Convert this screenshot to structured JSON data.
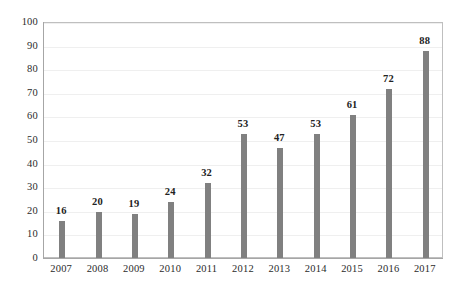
{
  "chart_data": {
    "type": "bar",
    "title": "",
    "subtitle": "",
    "xlabel": "",
    "ylabel": "",
    "categories": [
      "2007",
      "2008",
      "2009",
      "2010",
      "2011",
      "2012",
      "2013",
      "2014",
      "2015",
      "2016",
      "2017"
    ],
    "values": [
      16,
      20,
      19,
      24,
      32,
      53,
      47,
      53,
      61,
      72,
      88
    ],
    "data_labels": [
      "16",
      "20",
      "19",
      "24",
      "32",
      "53",
      "47",
      "53",
      "61",
      "72",
      "88"
    ],
    "ylim": [
      0,
      100
    ],
    "y_ticks": [
      0,
      10,
      20,
      30,
      40,
      50,
      60,
      70,
      80,
      90,
      100
    ],
    "y_tick_labels": [
      "0",
      "10",
      "20",
      "30",
      "40",
      "50",
      "60",
      "70",
      "80",
      "90",
      "100"
    ],
    "grid": true,
    "grid_axis": "y",
    "legend": false,
    "legend_position": "none",
    "series": [
      {
        "name": "",
        "values": [
          16,
          20,
          19,
          24,
          32,
          53,
          47,
          53,
          61,
          72,
          88
        ],
        "color": "#808080"
      }
    ]
  },
  "style": {
    "bar_color": "#808080",
    "gridline_color": "#efefef",
    "axis_color": "#a6a6a6",
    "plot_border_color": "#bfbfbf",
    "text_color": "#2b2b2b",
    "label_color": "#222222",
    "background_color": "#ffffff"
  }
}
